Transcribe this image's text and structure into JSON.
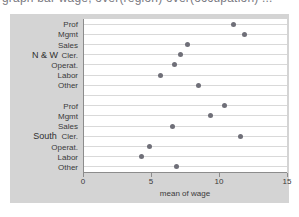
{
  "caption": {
    "clipped_text": "graph bar wage, over(region) over(occupation) ..."
  },
  "chart_data": {
    "type": "scatter",
    "title": "",
    "xlabel": "mean of wage",
    "ylabel": "",
    "xlim": [
      0,
      15
    ],
    "xticks": [
      0,
      5,
      10,
      15
    ],
    "xtick_labels": [
      "0",
      "5",
      "10",
      "15"
    ],
    "grid": true,
    "orientation": "horizontal",
    "legend": "none",
    "groups": [
      {
        "name": "N & W",
        "categories": [
          "Prof",
          "Mgmt",
          "Sales",
          "Cler.",
          "Operat.",
          "Labor",
          "Other"
        ],
        "values": [
          11.1,
          11.9,
          7.7,
          7.2,
          6.7,
          5.7,
          8.5
        ]
      },
      {
        "name": "South",
        "categories": [
          "Prof",
          "Mgmt",
          "Sales",
          "Cler.",
          "Operat.",
          "Labor",
          "Other"
        ],
        "values": [
          10.4,
          9.4,
          6.6,
          11.6,
          4.9,
          4.3,
          6.9
        ]
      }
    ],
    "marker": {
      "shape": "circle",
      "color": "#6f6f78",
      "size": 5
    },
    "colors": {
      "plot_background": "#ffffff",
      "graph_background": "#d4d4d4",
      "gridline": "#d9d9d9",
      "axis": "#8c8c8c",
      "text": "#3a3a3a"
    }
  }
}
